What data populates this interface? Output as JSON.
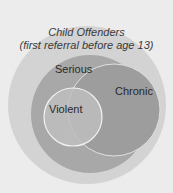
{
  "diagram": {
    "type": "nested-venn",
    "outer": {
      "line1": "Child Offenders",
      "line2": "(first referral before age 13)",
      "color": "#d3d3d3"
    },
    "sets": [
      {
        "label": "Serious",
        "color": "#a8a8a8"
      },
      {
        "label": "Chronic",
        "color": "#9d9d9d"
      },
      {
        "label": "Violent",
        "color": "#bebebe"
      }
    ],
    "background": "#ececec"
  }
}
